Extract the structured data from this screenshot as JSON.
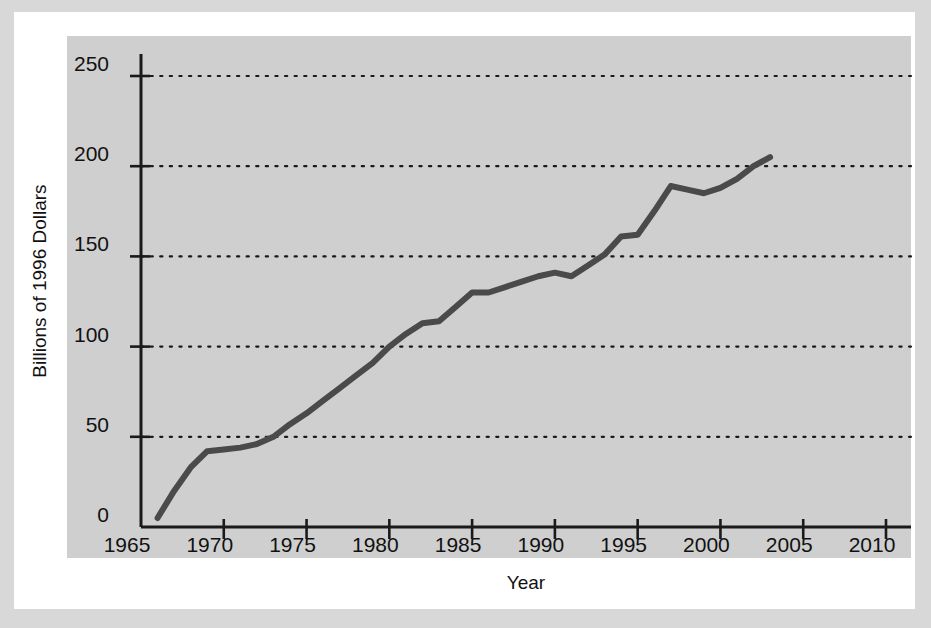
{
  "chart_data": {
    "type": "line",
    "title": "",
    "xlabel": "Year",
    "ylabel": "Billions of 1996 Dollars",
    "xlim": [
      1965,
      2012
    ],
    "ylim": [
      0,
      255
    ],
    "xticks": [
      1965,
      1970,
      1975,
      1980,
      1985,
      1990,
      1995,
      2000,
      2005,
      2010
    ],
    "xticklabels": [
      "1965",
      "1970",
      "1975",
      "1980",
      "1985",
      "1990",
      "1995",
      "2000",
      "2005",
      "2010"
    ],
    "yticks": [
      0,
      50,
      100,
      150,
      200,
      250
    ],
    "yticklabels": [
      "0",
      "50",
      "100",
      "150",
      "200",
      "250"
    ],
    "grid": "horizontal-dotted",
    "legend": "none",
    "line_color": "#4a4a4a",
    "panel_color": "#cfcfcf",
    "series": [
      {
        "name": "Spending",
        "x": [
          1966,
          1967,
          1968,
          1969,
          1970,
          1971,
          1972,
          1973,
          1974,
          1975,
          1976,
          1977,
          1978,
          1979,
          1980,
          1981,
          1982,
          1983,
          1984,
          1985,
          1986,
          1987,
          1988,
          1989,
          1990,
          1991,
          1992,
          1993,
          1994,
          1995,
          1996,
          1997,
          1998,
          1999,
          2000,
          2001,
          2002,
          2003
        ],
        "values": [
          5,
          20,
          33,
          42,
          43,
          44,
          46,
          50,
          57,
          63,
          70,
          77,
          84,
          91,
          100,
          107,
          113,
          114,
          122,
          130,
          130,
          133,
          136,
          139,
          141,
          139,
          145,
          151,
          161,
          162,
          175,
          189,
          187,
          185,
          188,
          193,
          200,
          205
        ]
      }
    ]
  },
  "axis": {
    "y_title": "Billions of 1996 Dollars",
    "x_title": "Year"
  }
}
